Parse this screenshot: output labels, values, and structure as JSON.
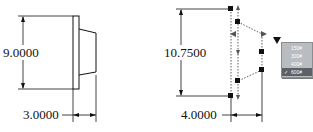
{
  "left_view": {
    "height_dim": "9.0000",
    "width_dim": "3.0000"
  },
  "right_view": {
    "height_dim": "10.7500",
    "width_dim": "4.0000"
  },
  "class_menu": {
    "items": [
      {
        "label": "150#",
        "selected": false
      },
      {
        "label": "300#",
        "selected": false
      },
      {
        "label": "400#",
        "selected": false
      },
      {
        "label": "600#",
        "selected": true
      }
    ],
    "check_glyph": "✓"
  },
  "colors": {
    "line": "#111111",
    "menu_bg": "#b9bcc0",
    "menu_selected": "#5d6066"
  }
}
